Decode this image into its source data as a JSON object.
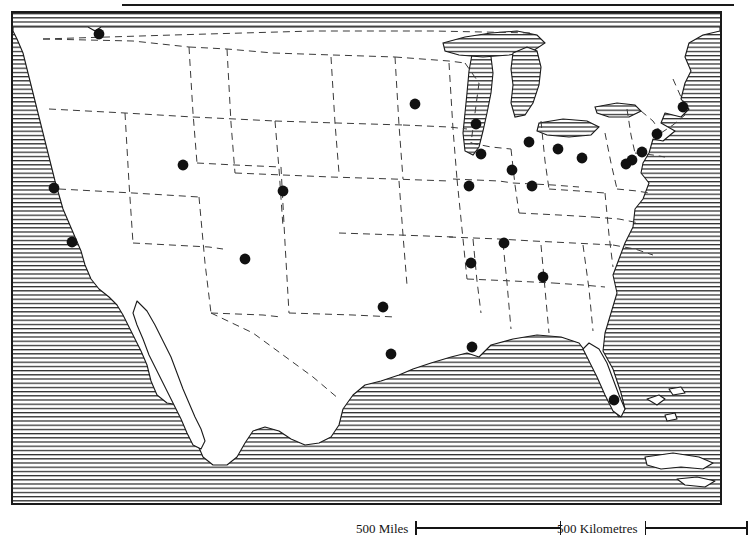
{
  "map": {
    "title": "United States major cities reference map",
    "projection_note": "conic",
    "frame": {
      "x": 11,
      "y": 11,
      "width": 711,
      "height": 494,
      "border_color": "#1a1a1a"
    },
    "top_rule": {
      "x": 122,
      "y": 4,
      "width": 612,
      "color": "#1a1a1a"
    },
    "ocean_fill": "horizontal-line-hatch",
    "land_fill": "#ffffff",
    "border_style": "dashed",
    "scale": {
      "miles": {
        "label": "500 Miles",
        "value": 500,
        "unit": "Miles",
        "bar_px": 146
      },
      "kilometres": {
        "label": "500 Kilometres",
        "value": 500,
        "unit": "Kilometres",
        "bar_px": 103
      }
    },
    "cities": [
      {
        "name": "Seattle",
        "x": 97,
        "y": 32
      },
      {
        "name": "San Francisco",
        "x": 52,
        "y": 186
      },
      {
        "name": "Los Angeles",
        "x": 70,
        "y": 240
      },
      {
        "name": "Salt Lake City",
        "x": 181,
        "y": 163
      },
      {
        "name": "Denver",
        "x": 281,
        "y": 189
      },
      {
        "name": "Phoenix",
        "x": 243,
        "y": 257
      },
      {
        "name": "Dallas",
        "x": 381,
        "y": 305
      },
      {
        "name": "Houston",
        "x": 389,
        "y": 352
      },
      {
        "name": "New Orleans",
        "x": 470,
        "y": 345
      },
      {
        "name": "Minneapolis",
        "x": 413,
        "y": 102
      },
      {
        "name": "Milwaukee",
        "x": 474,
        "y": 122
      },
      {
        "name": "Chicago",
        "x": 479,
        "y": 152
      },
      {
        "name": "Detroit",
        "x": 527,
        "y": 140
      },
      {
        "name": "Cleveland",
        "x": 556,
        "y": 147
      },
      {
        "name": "Pittsburgh",
        "x": 580,
        "y": 156
      },
      {
        "name": "Indianapolis",
        "x": 510,
        "y": 168
      },
      {
        "name": "Cincinnati",
        "x": 530,
        "y": 184
      },
      {
        "name": "St. Louis",
        "x": 467,
        "y": 184
      },
      {
        "name": "Nashville",
        "x": 502,
        "y": 241
      },
      {
        "name": "Memphis",
        "x": 469,
        "y": 261
      },
      {
        "name": "Atlanta",
        "x": 541,
        "y": 275
      },
      {
        "name": "Boston",
        "x": 681,
        "y": 105
      },
      {
        "name": "New York",
        "x": 655,
        "y": 132
      },
      {
        "name": "Philadelphia",
        "x": 640,
        "y": 150
      },
      {
        "name": "Baltimore",
        "x": 630,
        "y": 158
      },
      {
        "name": "Washington",
        "x": 624,
        "y": 162
      },
      {
        "name": "Miami",
        "x": 612,
        "y": 398
      }
    ]
  }
}
